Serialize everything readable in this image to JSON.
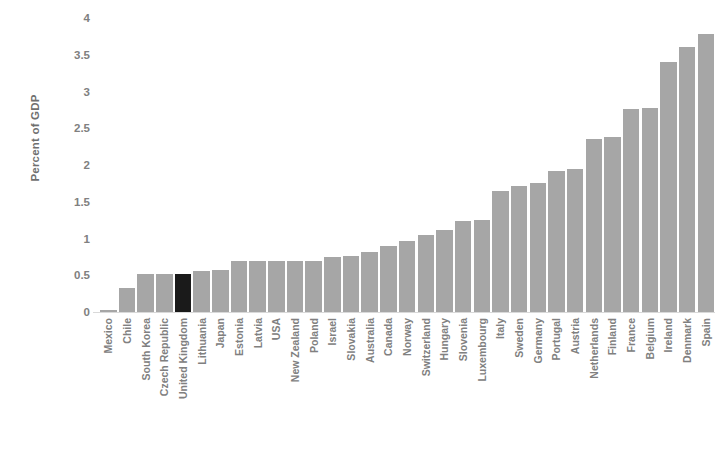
{
  "chart_data": {
    "type": "bar",
    "title": "",
    "xlabel": "",
    "ylabel": "Percent of GDP",
    "ylim": [
      0,
      4
    ],
    "yticks": [
      0,
      0.5,
      1,
      1.5,
      2,
      2.5,
      3,
      3.5,
      4
    ],
    "ytick_labels": [
      "0",
      "0.5",
      "1",
      "1.5",
      "2",
      "2.5",
      "3",
      "3.5",
      "4"
    ],
    "grid": false,
    "legend": "none",
    "bar_color": "#a6a6a6",
    "highlight_color": "#1a1a1a",
    "highlight_category": "United Kingdom",
    "categories": [
      "Mexico",
      "Chile",
      "South Korea",
      "Czech Republic",
      "United Kingdom",
      "Lithuania",
      "Japan",
      "Estonia",
      "Latvia",
      "USA",
      "New Zealand",
      "Poland",
      "Israel",
      "Slovakia",
      "Australia",
      "Canada",
      "Norway",
      "Switzerland",
      "Hungary",
      "Slovenia",
      "Luxembourg",
      "Italy",
      "Sweden",
      "Germany",
      "Portugal",
      "Austria",
      "Netherlands",
      "Finland",
      "France",
      "Belgium",
      "Ireland",
      "Denmark",
      "Spain"
    ],
    "values": [
      0.03,
      0.33,
      0.52,
      0.52,
      0.52,
      0.56,
      0.57,
      0.7,
      0.7,
      0.7,
      0.7,
      0.7,
      0.75,
      0.76,
      0.82,
      0.9,
      0.97,
      1.05,
      1.12,
      1.24,
      1.25,
      1.65,
      1.71,
      1.75,
      1.92,
      1.94,
      2.35,
      2.38,
      2.76,
      2.78,
      3.4,
      3.6,
      3.78
    ]
  }
}
